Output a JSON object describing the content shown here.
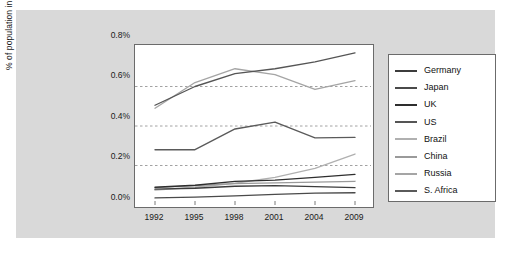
{
  "chart_data": {
    "type": "line",
    "title": "",
    "xlabel": "",
    "ylabel": "% of population in prison",
    "categories": [
      "1992",
      "1995",
      "1998",
      "2001",
      "2004",
      "2009"
    ],
    "x_tick_labels": [
      "1992",
      "1995",
      "1998",
      "2001",
      "2004",
      "2009"
    ],
    "y_tick_labels": [
      "0.0%",
      "0.2%",
      "0.4%",
      "0.6%",
      "0.8%"
    ],
    "y_tick_values": [
      0.0,
      0.2,
      0.4,
      0.6,
      0.8
    ],
    "ylim": [
      0.0,
      0.8
    ],
    "grid": "horizontal-dashed",
    "legend_position": "right-outside",
    "series": [
      {
        "name": "Germany",
        "color": "#3c3c3c",
        "values": [
          0.08,
          0.085,
          0.095,
          0.098,
          0.093,
          0.088
        ]
      },
      {
        "name": "Japan",
        "color": "#4a4a4a",
        "values": [
          0.036,
          0.04,
          0.046,
          0.054,
          0.06,
          0.062
        ]
      },
      {
        "name": "UK",
        "color": "#2e2e2e",
        "values": [
          0.09,
          0.1,
          0.12,
          0.126,
          0.14,
          0.155
        ]
      },
      {
        "name": "US",
        "color": "#555555",
        "values": [
          0.505,
          0.6,
          0.665,
          0.69,
          0.725,
          0.77
        ]
      },
      {
        "name": "Brazil",
        "color": "#b0b0b0",
        "values": [
          0.075,
          0.09,
          0.11,
          0.14,
          0.185,
          0.258
        ]
      },
      {
        "name": "China",
        "color": "#9a9a9a",
        "values": [
          0.088,
          0.098,
          0.108,
          0.112,
          0.116,
          0.12
        ]
      },
      {
        "name": "Russia",
        "color": "#a5a5a5",
        "values": [
          0.49,
          0.62,
          0.69,
          0.66,
          0.585,
          0.63
        ]
      },
      {
        "name": "S. Africa",
        "color": "#5a5a5a",
        "values": [
          0.28,
          0.28,
          0.385,
          0.42,
          0.34,
          0.342
        ]
      }
    ]
  },
  "legend": {
    "items": [
      {
        "label": "Germany"
      },
      {
        "label": "Japan"
      },
      {
        "label": "UK"
      },
      {
        "label": "US"
      },
      {
        "label": "Brazil"
      },
      {
        "label": "China"
      },
      {
        "label": "Russia"
      },
      {
        "label": "S. Africa"
      }
    ]
  },
  "colors": {
    "panel_background": "#d9d9d9",
    "plot_background": "#ffffff",
    "axis": "#6b6b6b",
    "grid": "#8a8a8a",
    "text": "#1a1a1a"
  }
}
